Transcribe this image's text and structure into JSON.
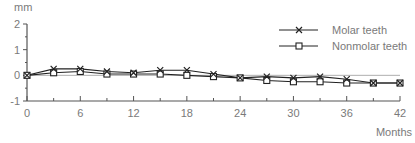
{
  "chart_data": {
    "type": "line",
    "title": "",
    "xlabel": "Months",
    "ylabel": "mm",
    "x": [
      0,
      3,
      6,
      9,
      12,
      15,
      18,
      21,
      24,
      27,
      30,
      33,
      36,
      39,
      42
    ],
    "xticks": [
      0,
      6,
      12,
      18,
      24,
      30,
      36,
      42
    ],
    "xlim": [
      0,
      42
    ],
    "yticks": [
      -1,
      0,
      1,
      2
    ],
    "ylim": [
      -1,
      2
    ],
    "grid": false,
    "legend_position": "upper right",
    "series": [
      {
        "name": "Molar teeth",
        "marker": "x",
        "values": [
          0,
          0.25,
          0.25,
          0.15,
          0.1,
          0.2,
          0.2,
          0.05,
          -0.1,
          -0.05,
          -0.1,
          -0.05,
          -0.15,
          -0.3,
          -0.3
        ]
      },
      {
        "name": "Nonmolar teeth",
        "marker": "square",
        "values": [
          0,
          0.1,
          0.15,
          0.05,
          0.05,
          0.05,
          0.0,
          -0.05,
          -0.1,
          -0.2,
          -0.25,
          -0.25,
          -0.3,
          -0.3,
          -0.3
        ]
      }
    ]
  },
  "colors": {
    "line": "#222222",
    "axis": "#555555",
    "text": "#7a7a7a"
  }
}
